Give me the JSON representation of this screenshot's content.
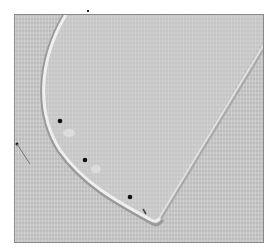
{
  "image": {
    "description": "Grayscale photo of a curved fabric panel with a stitched/pressed rounded edge meeting a straight edge at a point, held with pins",
    "background_color": "#c9c9c9",
    "fabric_color": "#cdcdcd",
    "edge_highlight_color": "#ececec",
    "pin_head_color": "#111111",
    "pin_count": 4
  }
}
